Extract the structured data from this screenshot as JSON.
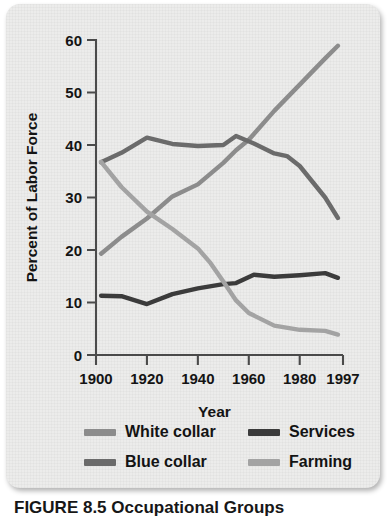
{
  "figure": {
    "caption": "FIGURE 8.5  Occupational Groups",
    "card_bg": "#ececeb"
  },
  "axes": {
    "ylabel": "Percent of Labor Force",
    "xlabel": "Year",
    "y_ticks": [
      "0",
      "10",
      "20",
      "30",
      "40",
      "50",
      "60"
    ],
    "x_ticks": [
      "1900",
      "1920",
      "1940",
      "1960",
      "1980",
      "1997"
    ]
  },
  "legend": {
    "position": "below-axes",
    "entries": [
      {
        "label": "White collar",
        "color": "#8c8c8c"
      },
      {
        "label": "Blue collar",
        "color": "#6b6b6b"
      },
      {
        "label": "Services",
        "color": "#3b3b3b"
      },
      {
        "label": "Farming",
        "color": "#a3a3a3"
      }
    ]
  },
  "chart_data": {
    "type": "line",
    "title": "FIGURE 8.5  Occupational Groups",
    "xlabel": "Year",
    "ylabel": "Percent of Labor Force",
    "xlim": [
      1900,
      1997
    ],
    "ylim": [
      0,
      60
    ],
    "y_ticks": [
      0,
      10,
      20,
      30,
      40,
      50,
      60
    ],
    "x_ticks": [
      1900,
      1920,
      1940,
      1960,
      1980,
      1997
    ],
    "grid": false,
    "legend_position": "below",
    "series": [
      {
        "name": "White collar",
        "color": "#8c8c8c",
        "x": [
          1902,
          1910,
          1920,
          1930,
          1940,
          1950,
          1955,
          1960,
          1970,
          1980,
          1990,
          1995
        ],
        "y": [
          19.3,
          22.5,
          26.0,
          30.2,
          32.5,
          36.6,
          39.0,
          41.0,
          46.5,
          51.5,
          56.5,
          58.9
        ]
      },
      {
        "name": "Blue collar",
        "color": "#6b6b6b",
        "x": [
          1902,
          1910,
          1920,
          1930,
          1940,
          1950,
          1955,
          1962,
          1970,
          1975,
          1980,
          1990,
          1995
        ],
        "y": [
          36.7,
          38.5,
          41.4,
          40.2,
          39.8,
          40.0,
          41.7,
          40.3,
          38.4,
          37.9,
          36.0,
          30.0,
          26.1
        ]
      },
      {
        "name": "Services",
        "color": "#3b3b3b",
        "x": [
          1902,
          1910,
          1920,
          1930,
          1940,
          1950,
          1955,
          1962,
          1970,
          1980,
          1990,
          1995
        ],
        "y": [
          11.3,
          11.2,
          9.7,
          11.6,
          12.7,
          13.5,
          13.7,
          15.3,
          14.9,
          15.2,
          15.6,
          14.7
        ]
      },
      {
        "name": "Farming",
        "color": "#a3a3a3",
        "x": [
          1902,
          1910,
          1920,
          1930,
          1940,
          1945,
          1950,
          1955,
          1960,
          1970,
          1980,
          1990,
          1995
        ],
        "y": [
          36.8,
          32.0,
          27.3,
          24.0,
          20.3,
          17.5,
          14.0,
          10.4,
          8.0,
          5.6,
          4.8,
          4.6,
          3.9
        ]
      }
    ]
  }
}
